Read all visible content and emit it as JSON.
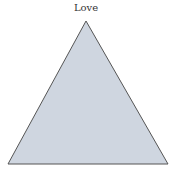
{
  "diagram": {
    "title": "Love",
    "shape": "triangle",
    "fill": "#cfd6e0",
    "stroke": "#555555",
    "vertices": [
      [
        86,
        21
      ],
      [
        8,
        164
      ],
      [
        168,
        164
      ]
    ]
  }
}
